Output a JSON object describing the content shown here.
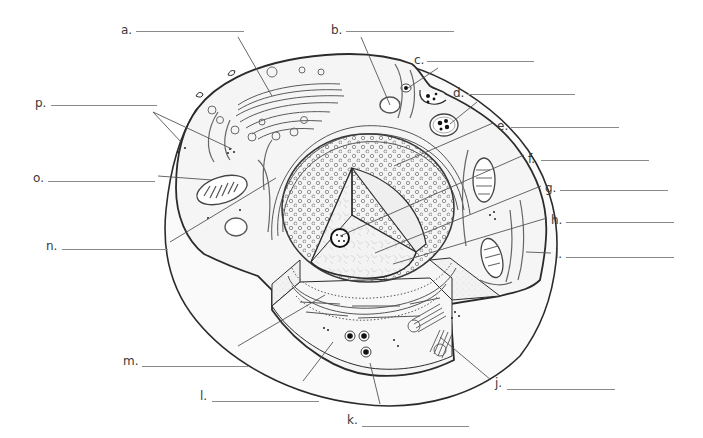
{
  "diagram": {
    "type": "labeling-worksheet",
    "labels": [
      {
        "key": "a",
        "text": "a.",
        "x": 121,
        "y": 23,
        "line_x1": 136,
        "line_x2": 244,
        "line_y": 31,
        "target": [
          272,
          96
        ],
        "leader_from": [
          238,
          37
        ]
      },
      {
        "key": "b",
        "text": "b.",
        "x": 331,
        "y": 23,
        "line_x1": 346,
        "line_x2": 454,
        "line_y": 31,
        "target": [
          390,
          105
        ],
        "leader_from": [
          361,
          37
        ]
      },
      {
        "key": "c",
        "text": "c.",
        "x": 414,
        "y": 53,
        "line_x1": 427,
        "line_x2": 534,
        "line_y": 61,
        "target": [
          408,
          88
        ],
        "leader_from": [
          438,
          68
        ]
      },
      {
        "key": "d",
        "text": "d.",
        "x": 453,
        "y": 86,
        "line_x1": 468,
        "line_x2": 575,
        "line_y": 94,
        "target": [
          450,
          124
        ],
        "leader_from": [
          477,
          102
        ]
      },
      {
        "key": "e",
        "text": "e.",
        "x": 497,
        "y": 119,
        "line_x1": 511,
        "line_x2": 619,
        "line_y": 127,
        "target": [
          394,
          166
        ],
        "leader_from": [
          493,
          123
        ]
      },
      {
        "key": "f",
        "text": "f.",
        "x": 528,
        "y": 152,
        "line_x1": 541,
        "line_x2": 649,
        "line_y": 160,
        "target": [
          340,
          236
        ],
        "leader_from": [
          524,
          155
        ]
      },
      {
        "key": "g",
        "text": "g.",
        "x": 545,
        "y": 181,
        "line_x1": 560,
        "line_x2": 668,
        "line_y": 190,
        "target": [
          375,
          253
        ],
        "leader_from": [
          541,
          186
        ]
      },
      {
        "key": "h",
        "text": "h.",
        "x": 551,
        "y": 213,
        "line_x1": 566,
        "line_x2": 674,
        "line_y": 222,
        "target": [
          393,
          264
        ],
        "leader_from": [
          547,
          218
        ]
      },
      {
        "key": "i",
        "text": "i.",
        "x": 555,
        "y": 247,
        "line_x1": 566,
        "line_x2": 674,
        "line_y": 257,
        "target": [
          526,
          252
        ],
        "leader_from": [
          551,
          253
        ]
      },
      {
        "key": "j",
        "text": "j.",
        "x": 495,
        "y": 376,
        "line_x1": 507,
        "line_x2": 615,
        "line_y": 389,
        "target": [
          440,
          337
        ],
        "leader_from": [
          491,
          380
        ]
      },
      {
        "key": "k",
        "text": "k.",
        "x": 347,
        "y": 413,
        "line_x1": 362,
        "line_x2": 469,
        "line_y": 426,
        "target": [
          370,
          363
        ],
        "leader_from": [
          380,
          404
        ]
      },
      {
        "key": "l",
        "text": "l.",
        "x": 200,
        "y": 389,
        "line_x1": 212,
        "line_x2": 319,
        "line_y": 401,
        "target": [
          333,
          342
        ],
        "leader_from": [
          303,
          381
        ]
      },
      {
        "key": "m",
        "text": "m.",
        "x": 123,
        "y": 354,
        "line_x1": 142,
        "line_x2": 249,
        "line_y": 366,
        "target": [
          325,
          295
        ],
        "leader_from": [
          238,
          346
        ]
      },
      {
        "key": "n",
        "text": "n.",
        "x": 46,
        "y": 239,
        "line_x1": 62,
        "line_x2": 168,
        "line_y": 249,
        "target": [
          276,
          178
        ],
        "leader_from": [
          170,
          242
        ]
      },
      {
        "key": "o",
        "text": "o.",
        "x": 33,
        "y": 171,
        "line_x1": 48,
        "line_x2": 155,
        "line_y": 181,
        "target": [
          212,
          180
        ],
        "leader_from": [
          158,
          176
        ]
      },
      {
        "key": "p",
        "text": "p.",
        "x": 35,
        "y": 96,
        "line_x1": 51,
        "line_x2": 157,
        "line_y": 105,
        "targets": [
          [
            181,
            142
          ],
          [
            232,
            149
          ]
        ],
        "leader_from": [
          153,
          112
        ]
      }
    ],
    "organelles": [
      "golgi-apparatus",
      "vesicle",
      "endocytic-vesicle",
      "pinocytosis-pocket",
      "lysosome",
      "nucleus-pores",
      "nucleolus",
      "nucleoplasm-chromatin",
      "nuclear-envelope",
      "mitochondrion",
      "smooth-er",
      "rough-er",
      "centrioles",
      "ribosomes",
      "cytoplasm",
      "cell-membrane"
    ],
    "colors": {
      "outline": "#2b2b2b",
      "membrane": "#3a3a3a",
      "cytoplasm": "#f6f6f6",
      "cut_face": "#ececec",
      "nucleus_face": "#f1f1f1",
      "leader": "#555555",
      "blank_line": "#8a8a8a",
      "label_text": "#3a3a3a"
    }
  }
}
